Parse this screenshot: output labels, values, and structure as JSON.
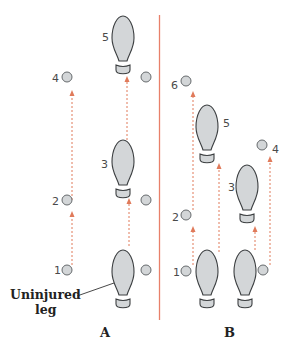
{
  "figure": {
    "panels": [
      {
        "id": "A",
        "label": "A",
        "annotation": {
          "line1": "Uninjured",
          "line2": "leg"
        },
        "step_numbers": {
          "s1": "1",
          "s2": "2",
          "s3": "3",
          "s4": "4",
          "s5": "5"
        }
      },
      {
        "id": "B",
        "label": "B",
        "step_numbers": {
          "s1": "1",
          "s2": "2",
          "s3": "3",
          "s4": "4",
          "s5": "5",
          "s6": "6"
        }
      }
    ],
    "colors": {
      "divider": "#e8806a",
      "arrow": "#e07a5a",
      "footprint_fill": "#d3d6d8",
      "footprint_stroke": "#3c3f41",
      "crutch_fill": "#d3d6d8"
    }
  }
}
